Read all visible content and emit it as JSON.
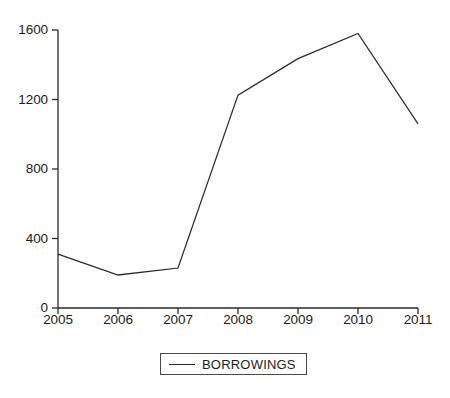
{
  "chart_data": {
    "type": "line",
    "title": "",
    "subtitle": "",
    "xlabel": "",
    "ylabel": "",
    "categories": [
      "2005",
      "2006",
      "2007",
      "2008",
      "2009",
      "2010",
      "2011"
    ],
    "series": [
      {
        "name": "BORROWINGS",
        "values": [
          310,
          190,
          230,
          1225,
          1435,
          1580,
          1060
        ],
        "color": "#2a2a2a"
      }
    ],
    "ylim": [
      0,
      1600
    ],
    "y_ticks": [
      0,
      400,
      800,
      1200,
      1600
    ],
    "y_tick_labels": [
      "0",
      "400",
      "800",
      "1200",
      "1600"
    ],
    "x_tick_labels": [
      "2005",
      "2006",
      "2007",
      "2008",
      "2009",
      "2010",
      "2011"
    ],
    "grid": false,
    "legend": {
      "position": "bottom-center",
      "entries": [
        {
          "label": "BORROWINGS",
          "marker": "line",
          "color": "#2a2a2a"
        }
      ]
    },
    "axis_color": "#2a2a2a",
    "background": "#ffffff"
  }
}
